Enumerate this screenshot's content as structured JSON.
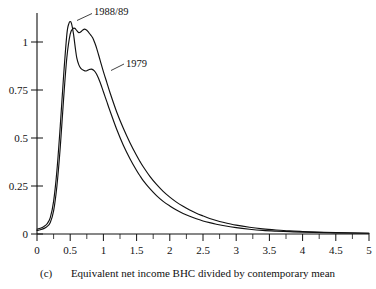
{
  "figure": {
    "panel_label": "(c)",
    "xlabel": "Equivalent net income BHC divided by contemporary mean",
    "ylabel": ""
  },
  "axes": {
    "x_tick_labels": [
      "0",
      "0.5",
      "1",
      "1.5",
      "2",
      "2.5",
      "3",
      "3.5",
      "4",
      "4.5",
      "5"
    ],
    "y_tick_labels": [
      "0",
      "0.25",
      "0.5",
      "0.75",
      "1"
    ]
  },
  "legend": {
    "series_a_label": "1988/89",
    "series_b_label": "1979"
  },
  "colors": {
    "curve": "#111111",
    "axis": "#111111",
    "background": "#ffffff"
  },
  "chart_data": {
    "type": "line",
    "title": "",
    "subtitle": "",
    "xlabel": "Equivalent net income BHC divided by contemporary mean",
    "ylabel": "",
    "xlim": [
      0,
      5
    ],
    "ylim": [
      0,
      1.15
    ],
    "xticks": [
      0,
      0.5,
      1,
      1.5,
      2,
      2.5,
      3,
      3.5,
      4,
      4.5,
      5
    ],
    "xtick_minor_step": 0.25,
    "yticks": [
      0,
      0.25,
      0.5,
      0.75,
      1
    ],
    "grid": false,
    "legend": "inline-annotations",
    "annotations": [
      {
        "text": "1988/89",
        "x": 1.0,
        "y": 1.16,
        "points_to": {
          "x": 0.62,
          "y": 1.06
        }
      },
      {
        "text": "1979",
        "x": 1.62,
        "y": 0.9,
        "points_to": {
          "x": 1.18,
          "y": 0.8
        }
      },
      {
        "text": "(c)",
        "x": 0.05,
        "y": -0.18
      }
    ],
    "series": [
      {
        "name": "1979",
        "x": [
          0.0,
          0.05,
          0.1,
          0.15,
          0.2,
          0.25,
          0.3,
          0.35,
          0.4,
          0.45,
          0.48,
          0.5,
          0.52,
          0.55,
          0.58,
          0.6,
          0.63,
          0.66,
          0.7,
          0.74,
          0.78,
          0.82,
          0.86,
          0.9,
          0.95,
          1.0,
          1.05,
          1.1,
          1.2,
          1.3,
          1.4,
          1.5,
          1.55,
          1.6,
          1.7,
          1.8,
          1.9,
          2.0,
          2.1,
          2.2,
          2.3,
          2.4,
          2.5,
          2.6,
          2.7,
          2.8,
          3.0,
          3.2,
          3.4,
          3.6,
          3.8,
          4.0,
          4.5,
          5.0
        ],
        "y": [
          0.025,
          0.03,
          0.038,
          0.052,
          0.085,
          0.17,
          0.33,
          0.56,
          0.82,
          1.04,
          1.095,
          1.105,
          1.095,
          1.04,
          0.96,
          0.915,
          0.88,
          0.862,
          0.852,
          0.848,
          0.855,
          0.858,
          0.85,
          0.83,
          0.79,
          0.74,
          0.69,
          0.64,
          0.545,
          0.462,
          0.392,
          0.33,
          0.303,
          0.278,
          0.236,
          0.2,
          0.17,
          0.146,
          0.125,
          0.107,
          0.092,
          0.079,
          0.068,
          0.059,
          0.051,
          0.044,
          0.033,
          0.025,
          0.019,
          0.015,
          0.012,
          0.01,
          0.006,
          0.004
        ]
      },
      {
        "name": "1988/89",
        "x": [
          0.0,
          0.05,
          0.1,
          0.15,
          0.2,
          0.25,
          0.3,
          0.35,
          0.4,
          0.45,
          0.5,
          0.54,
          0.57,
          0.6,
          0.63,
          0.66,
          0.69,
          0.72,
          0.75,
          0.78,
          0.81,
          0.84,
          0.87,
          0.9,
          0.95,
          1.0,
          1.05,
          1.1,
          1.2,
          1.3,
          1.4,
          1.5,
          1.55,
          1.6,
          1.7,
          1.8,
          1.9,
          2.0,
          2.1,
          2.2,
          2.3,
          2.4,
          2.5,
          2.6,
          2.7,
          2.8,
          3.0,
          3.2,
          3.4,
          3.6,
          3.8,
          4.0,
          4.5,
          5.0
        ],
        "y": [
          0.018,
          0.022,
          0.028,
          0.038,
          0.06,
          0.12,
          0.25,
          0.45,
          0.7,
          0.92,
          1.04,
          1.068,
          1.07,
          1.058,
          1.048,
          1.052,
          1.062,
          1.066,
          1.06,
          1.048,
          1.035,
          1.02,
          0.995,
          0.965,
          0.905,
          0.845,
          0.79,
          0.735,
          0.635,
          0.55,
          0.475,
          0.408,
          0.378,
          0.35,
          0.3,
          0.258,
          0.222,
          0.192,
          0.166,
          0.144,
          0.125,
          0.108,
          0.094,
          0.081,
          0.07,
          0.061,
          0.046,
          0.035,
          0.027,
          0.021,
          0.016,
          0.013,
          0.007,
          0.004
        ]
      }
    ]
  }
}
